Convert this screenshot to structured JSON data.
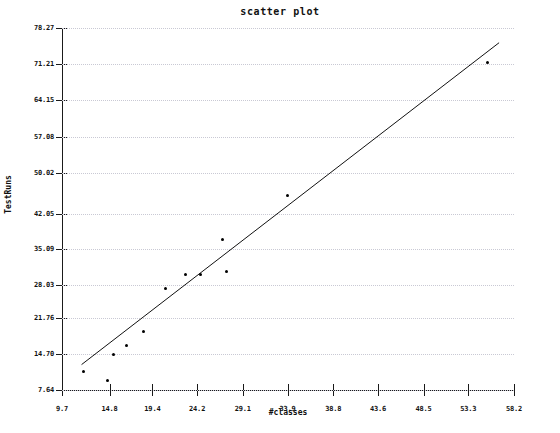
{
  "chart_data": {
    "type": "scatter",
    "title": "scatter plot",
    "xlabel": "#classes",
    "ylabel": "TestRuns",
    "xlim": [
      9.7,
      58.2
    ],
    "ylim": [
      7.64,
      78.27
    ],
    "grid": true,
    "legend": "none",
    "xticks": [
      "9.7",
      "14.8",
      "19.4",
      "24.2",
      "29.1",
      "33.9",
      "38.8",
      "43.6",
      "48.5",
      "53.3",
      "58.2"
    ],
    "yticks": [
      "7.64",
      "14.70",
      "21.76",
      "28.03",
      "35.09",
      "42.05",
      "50.02",
      "57.08",
      "64.15",
      "71.21",
      "78.27"
    ],
    "xtick_values": [
      9.7,
      14.8,
      19.4,
      24.2,
      29.1,
      33.9,
      38.8,
      43.6,
      48.5,
      53.3,
      58.2
    ],
    "ytick_values": [
      7.64,
      14.7,
      21.76,
      28.03,
      35.09,
      42.05,
      50.02,
      57.08,
      64.15,
      71.21,
      78.27
    ],
    "points": [
      {
        "x": 12.0,
        "y": 11.2
      },
      {
        "x": 14.6,
        "y": 9.5
      },
      {
        "x": 15.2,
        "y": 14.5
      },
      {
        "x": 16.6,
        "y": 16.3
      },
      {
        "x": 18.4,
        "y": 19.0
      },
      {
        "x": 20.8,
        "y": 27.4
      },
      {
        "x": 23.0,
        "y": 30.2
      },
      {
        "x": 24.6,
        "y": 30.2
      },
      {
        "x": 26.9,
        "y": 37.0
      },
      {
        "x": 27.4,
        "y": 30.8
      },
      {
        "x": 33.9,
        "y": 45.6
      },
      {
        "x": 55.4,
        "y": 71.5
      }
    ],
    "fit_line": {
      "label": "linear fit",
      "x1": 11.8,
      "y1": 12.6,
      "x2": 56.6,
      "y2": 75.4
    }
  }
}
